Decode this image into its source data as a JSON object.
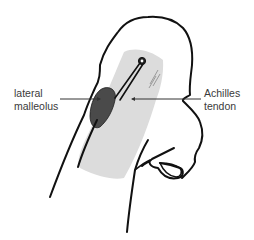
{
  "figure": {
    "colors": {
      "outline": "#111111",
      "tendon_fill": "#dcdcdc",
      "malleolus_fill": "#4a4a4a",
      "leader_line": "#333333",
      "label_text": "#3a3a3a",
      "background": "#ffffff"
    }
  },
  "labels": {
    "left": {
      "line1": "lateral",
      "line2": "malleolus"
    },
    "right": {
      "line1": "Achilles",
      "line2": "tendon"
    }
  }
}
